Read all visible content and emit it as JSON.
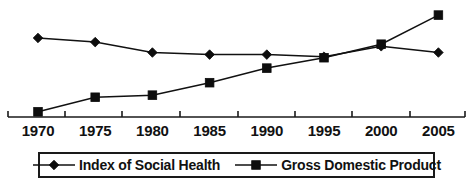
{
  "chart_data": {
    "type": "line",
    "title": "",
    "xlabel": "",
    "ylabel": "",
    "grid": false,
    "legend_position": "bottom",
    "categories": [
      "1970",
      "1975",
      "1980",
      "1985",
      "1990",
      "1995",
      "2000",
      "2005"
    ],
    "x_tick_labels": [
      "1970",
      "1975",
      "1980",
      "1985",
      "1990",
      "1995",
      "2000",
      "2005"
    ],
    "y_axis_visible": false,
    "ylim": [
      0,
      100
    ],
    "series": [
      {
        "name": "Index of Social Health",
        "marker": "diamond",
        "color": "#111111",
        "values": [
          76,
          72,
          62,
          60,
          60,
          58,
          68,
          62
        ]
      },
      {
        "name": "Gross Domestic Product",
        "marker": "square",
        "color": "#111111",
        "values": [
          5,
          19,
          21,
          33,
          47,
          57,
          70,
          98
        ]
      }
    ],
    "legend": [
      {
        "label": "Index of Social Health",
        "marker": "diamond-marker-icon"
      },
      {
        "label": "Gross Domestic Product",
        "marker": "square-marker-icon"
      }
    ]
  }
}
